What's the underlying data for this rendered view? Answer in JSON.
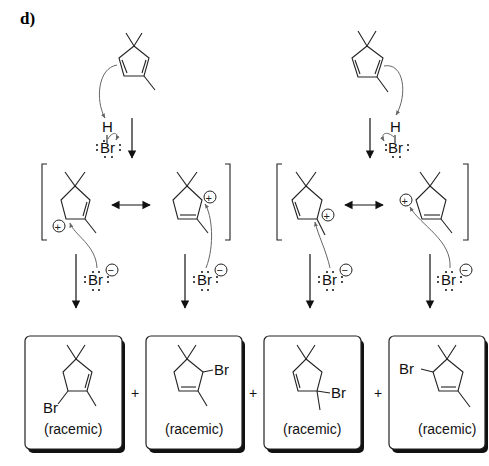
{
  "panel_label": "d)",
  "atoms": {
    "H": "H",
    "Br": "Br",
    "plus_charge": "+",
    "minus_charge": "−"
  },
  "reaction": {
    "reagent": "HBr",
    "starting_material": "1,5,5-trimethylcyclopenta-1,3-diene (drawn twice, two protonation sites)",
    "pathways": [
      {
        "name": "left",
        "protonation": "H adds to diene, giving allylic cation",
        "resonance_forms": 2
      },
      {
        "name": "right",
        "protonation": "H adds to other alkene, giving allylic cation",
        "resonance_forms": 2
      }
    ]
  },
  "products": [
    {
      "label": "(racemic)",
      "substituent": "Br"
    },
    {
      "label": "(racemic)",
      "substituent": "Br"
    },
    {
      "label": "(racemic)",
      "substituent": "Br"
    },
    {
      "label": "(racemic)",
      "substituent": "Br"
    }
  ],
  "plus_signs": [
    "+",
    "+",
    "+"
  ]
}
